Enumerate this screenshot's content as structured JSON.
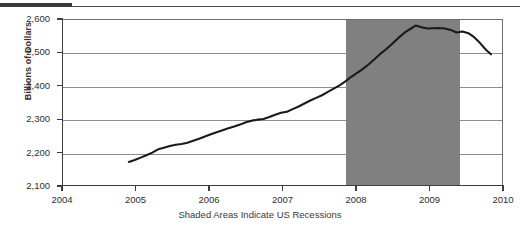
{
  "chart_data": {
    "type": "line",
    "title": "",
    "subtitle": "",
    "xlabel": "",
    "ylabel": "Billions of Dollars",
    "caption": "Shaded Areas Indicate US Recessions",
    "xlim": [
      2004,
      2010
    ],
    "ylim": [
      2100,
      2600
    ],
    "grid": "horizontal",
    "legend": "none",
    "xticks": [
      2004,
      2005,
      2006,
      2007,
      2008,
      2009,
      2010
    ],
    "xtick_labels": [
      "2004",
      "2005",
      "2006",
      "2007",
      "2008",
      "2009",
      "2010"
    ],
    "yticks": [
      2100,
      2200,
      2300,
      2400,
      2500,
      2600
    ],
    "ytick_labels": [
      "2,100",
      "2,200",
      "2,300",
      "2,400",
      "2,500",
      "2,600"
    ],
    "line_color": "#1a1a1a",
    "line_width": 2.1,
    "shaded_regions": [
      {
        "label": "US Recession",
        "x_start": 2007.85,
        "x_end": 2009.4,
        "color": "#808080"
      }
    ],
    "series": [
      {
        "name": "Series 1",
        "x": [
          2004.9,
          2004.98,
          2005.06,
          2005.14,
          2005.22,
          2005.3,
          2005.38,
          2005.46,
          2005.54,
          2005.62,
          2005.7,
          2005.78,
          2005.86,
          2005.94,
          2006.02,
          2006.1,
          2006.18,
          2006.26,
          2006.34,
          2006.42,
          2006.5,
          2006.58,
          2006.66,
          2006.74,
          2006.82,
          2006.9,
          2006.98,
          2007.06,
          2007.14,
          2007.22,
          2007.3,
          2007.38,
          2007.46,
          2007.54,
          2007.62,
          2007.7,
          2007.78,
          2007.86,
          2007.94,
          2008.02,
          2008.1,
          2008.18,
          2008.26,
          2008.34,
          2008.42,
          2008.5,
          2008.58,
          2008.66,
          2008.74,
          2008.82,
          2008.9,
          2008.98,
          2009.06,
          2009.14,
          2009.22,
          2009.3,
          2009.38,
          2009.46,
          2009.54,
          2009.62,
          2009.7,
          2009.78,
          2009.85
        ],
        "y": [
          2170,
          2176,
          2183,
          2190,
          2198,
          2208,
          2213,
          2218,
          2222,
          2224,
          2228,
          2234,
          2240,
          2247,
          2254,
          2260,
          2266,
          2272,
          2277,
          2283,
          2290,
          2295,
          2298,
          2300,
          2306,
          2313,
          2319,
          2322,
          2330,
          2338,
          2347,
          2356,
          2364,
          2372,
          2382,
          2392,
          2402,
          2414,
          2428,
          2440,
          2452,
          2466,
          2482,
          2498,
          2512,
          2528,
          2545,
          2560,
          2572,
          2583,
          2578,
          2574,
          2575,
          2576,
          2574,
          2570,
          2562,
          2565,
          2560,
          2548,
          2530,
          2510,
          2496
        ]
      }
    ]
  },
  "axis": {
    "y_title": "Billions of Dollars"
  },
  "figure": {
    "caption": "Shaded Areas Indicate US Recessions"
  }
}
